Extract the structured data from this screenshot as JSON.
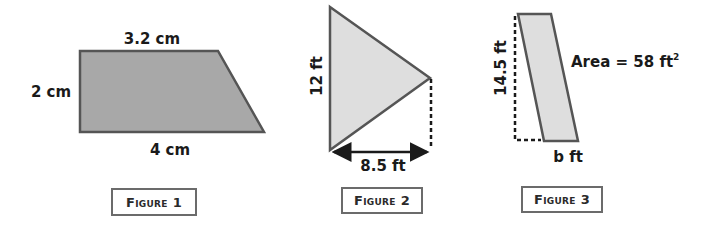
{
  "figures": [
    {
      "caption": "Figure 1",
      "shape": "trapezoid",
      "fill": "#a8a8a8",
      "labels": {
        "top": "3.2 cm",
        "left": "2 cm",
        "bottom": "4 cm"
      }
    },
    {
      "caption": "Figure 2",
      "shape": "triangle",
      "fill": "#dedede",
      "labels": {
        "base": "12 ft",
        "height": "8.5 ft"
      }
    },
    {
      "caption": "Figure 3",
      "shape": "parallelogram",
      "fill": "#dedede",
      "labels": {
        "height": "14.5 ft",
        "area": "Area = 58 ft",
        "area_exponent": "2",
        "base": "b ft"
      }
    }
  ],
  "colors": {
    "stroke": "#555555",
    "text": "#1a1a1a",
    "box_border": "#6b6b6b"
  }
}
